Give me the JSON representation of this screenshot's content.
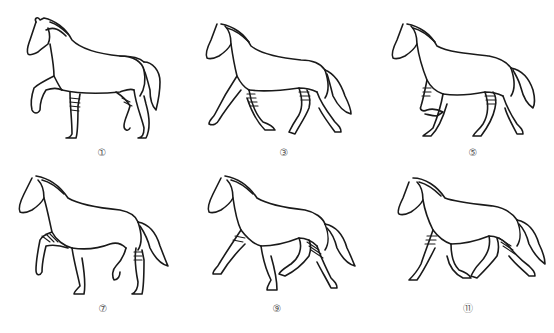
{
  "diagram": {
    "stroke_color": "#1a1a1a",
    "label_color": "#555555",
    "figures": [
      {
        "label": "①",
        "row": 0,
        "col": 0
      },
      {
        "label": "③",
        "row": 0,
        "col": 1
      },
      {
        "label": "⑤",
        "row": 0,
        "col": 2
      },
      {
        "label": "⑦",
        "row": 1,
        "col": 0
      },
      {
        "label": "⑨",
        "row": 1,
        "col": 1
      },
      {
        "label": "⑪",
        "row": 1,
        "col": 2
      }
    ]
  }
}
